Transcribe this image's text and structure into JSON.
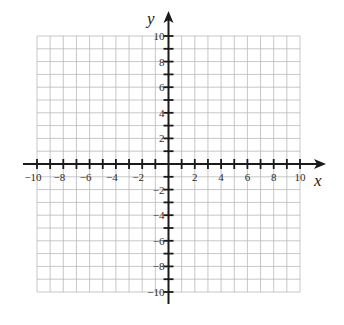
{
  "chart_data": {
    "type": "scatter",
    "title": "",
    "subtitle": "",
    "xlabel": "x",
    "ylabel": "y",
    "xlim": [
      -10,
      10
    ],
    "ylim": [
      -10,
      10
    ],
    "grid": true,
    "grid_step": 1,
    "tick_step": 1,
    "label_step": 2,
    "x_tick_labels": [
      "−10",
      "−8",
      "−6",
      "−4",
      "−2",
      "2",
      "4",
      "6",
      "8",
      "10"
    ],
    "y_tick_labels": [
      "10",
      "8",
      "6",
      "4",
      "2",
      "−2",
      "−4",
      "−6",
      "−8",
      "−10"
    ],
    "x_tick_values": [
      -10,
      -8,
      -6,
      -4,
      -2,
      2,
      4,
      6,
      8,
      10
    ],
    "y_tick_values": [
      10,
      8,
      6,
      4,
      2,
      -2,
      -4,
      -6,
      -8,
      -10
    ],
    "series": [],
    "legend": null,
    "colors": {
      "grid": "#b9b9b9",
      "axis": "#1a1a1a",
      "background": "#ffffff"
    }
  }
}
